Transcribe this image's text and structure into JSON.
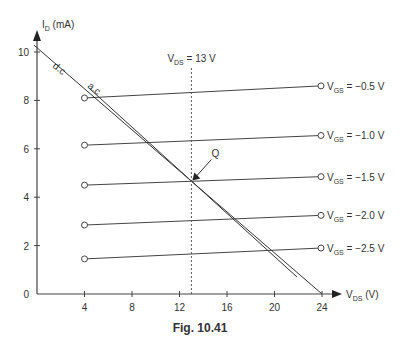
{
  "chart_data": {
    "type": "line",
    "title": "",
    "caption": "Fig. 10.41",
    "xlabel": "V_DS (V)",
    "xlabel_main": "V",
    "xlabel_sub": "DS",
    "xlabel_unit": " (V)",
    "ylabel": "I_D (mA)",
    "ylabel_main": "I",
    "ylabel_sub": "D",
    "ylabel_unit": " (mA)",
    "xlim": [
      0,
      24
    ],
    "ylim": [
      0,
      10
    ],
    "xticks": [
      4,
      8,
      12,
      16,
      20,
      24
    ],
    "yticks": [
      0,
      2,
      4,
      6,
      8,
      10
    ],
    "grid": false,
    "series": [
      {
        "name": "V_GS = −0.5 V",
        "label_main": "V",
        "label_sub": "GS",
        "label_value": " = −0.5 V",
        "x": [
          4,
          24
        ],
        "y": [
          8.1,
          8.6
        ]
      },
      {
        "name": "V_GS = −1.0 V",
        "label_main": "V",
        "label_sub": "GS",
        "label_value": " = −1.0 V",
        "x": [
          4,
          24
        ],
        "y": [
          6.15,
          6.55
        ]
      },
      {
        "name": "V_GS = −1.5 V",
        "label_main": "V",
        "label_sub": "GS",
        "label_value": " = −1.5 V",
        "x": [
          4,
          24
        ],
        "y": [
          4.5,
          4.85
        ]
      },
      {
        "name": "V_GS = −2.0 V",
        "label_main": "V",
        "label_sub": "GS",
        "label_value": " = −2.0 V",
        "x": [
          4,
          24
        ],
        "y": [
          2.85,
          3.25
        ]
      },
      {
        "name": "V_GS = −2.5 V",
        "label_main": "V",
        "label_sub": "GS",
        "label_value": " = −2.5 V",
        "x": [
          4,
          24
        ],
        "y": [
          1.45,
          1.9
        ]
      }
    ],
    "load_lines": [
      {
        "name": "d.c.",
        "x": [
          0,
          24
        ],
        "y": [
          10.2,
          0
        ]
      },
      {
        "name": "a.c.",
        "x": [
          4.4,
          21.9
        ],
        "y": [
          8.5,
          0.7
        ]
      }
    ],
    "annotations": [
      {
        "text": "V_DS = 13 V",
        "main": "V",
        "sub": "DS",
        "rest": " = 13 V",
        "type": "vertical-dashed-line",
        "x": 13
      },
      {
        "text": "Q",
        "type": "operating-point",
        "x": 13,
        "y": 4.65
      },
      {
        "text": "d.c",
        "type": "line-label"
      },
      {
        "text": "a.c",
        "type": "line-label"
      }
    ]
  }
}
